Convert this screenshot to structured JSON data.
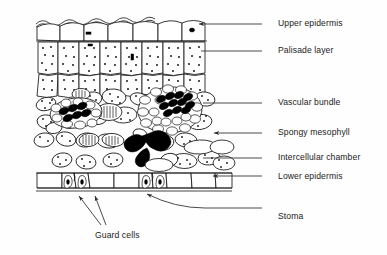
{
  "diagram": {
    "ink_color": "#141414",
    "background_color": "#fefefe",
    "xylem_fill": "#000000",
    "chamber_fill": "#000000"
  },
  "labels": [
    {
      "id": "upper-epidermis",
      "text": "Upper epidermis",
      "x": 278,
      "y": 19,
      "leader_y": 24,
      "leader_x1": 262,
      "leader_x2": 200,
      "arrow": true,
      "arrow_x": 199
    },
    {
      "id": "palisade-layer",
      "text": "Palisade layer",
      "x": 278,
      "y": 46,
      "leader_y": 51,
      "leader_x1": 262,
      "leader_x2": 201,
      "arrow": false,
      "arrow_x": 201
    },
    {
      "id": "vascular-bundle",
      "text": "Vascular bundle",
      "x": 278,
      "y": 98,
      "leader_y": 103,
      "leader_x1": 262,
      "leader_x2": 203,
      "arrow": false,
      "arrow_x": 203
    },
    {
      "id": "spongy-mesophyll",
      "text": "Spongy mesophyll",
      "x": 278,
      "y": 128,
      "leader_y": 133,
      "leader_x1": 262,
      "leader_x2": 215,
      "arrow": true,
      "arrow_x": 214
    },
    {
      "id": "intercellular-chamber",
      "text": "Intercellular chamber",
      "x": 278,
      "y": 153,
      "leader_y": 158,
      "leader_x1": 262,
      "leader_x2": 203,
      "arrow": false,
      "arrow_x": 203
    },
    {
      "id": "lower-epidermis",
      "text": "Lower epidermis",
      "x": 278,
      "y": 172,
      "leader_y": 176,
      "leader_x1": 262,
      "leader_x2": 214,
      "arrow": true,
      "arrow_x": 213
    },
    {
      "id": "stoma",
      "text": "Stoma",
      "x": 278,
      "y": 212,
      "leader_y": 208,
      "leader_x1": 262,
      "leader_x2": 200,
      "arrow": false,
      "arrow_x": 200
    },
    {
      "id": "guard-cells",
      "text": "Guard cells",
      "x": 95,
      "y": 231,
      "leader_y": 0,
      "leader_x1": 0,
      "leader_x2": 0,
      "arrow": false,
      "arrow_x": 0
    }
  ],
  "structures": {
    "upper_epidermis": {
      "name": "Upper epidermis",
      "cell_count": 7,
      "description": "single row of flattened rectangular cells along the top with a wavy cuticle line above"
    },
    "palisade_layer": {
      "name": "Palisade layer",
      "rows": 2,
      "description": "columnar cells packed with chloroplast dots"
    },
    "vascular_bundles": {
      "name": "Vascular bundle",
      "count": 2,
      "description": "oval bundles with dark filled xylem cells and surrounding sheath"
    },
    "spongy_mesophyll": {
      "name": "Spongy mesophyll",
      "description": "loosely packed rounded cells with air spaces"
    },
    "intercellular_chamber": {
      "name": "Intercellular chamber",
      "description": "solid black air space above the stoma"
    },
    "lower_epidermis": {
      "name": "Lower epidermis",
      "description": "single row of flattened cells along the bottom"
    },
    "stomata": {
      "name": "Stoma",
      "count": 3,
      "description": "pores between pairs of guard cells in the lower epidermis"
    },
    "guard_cells": {
      "name": "Guard cells",
      "description": "bean-shaped cells flanking each stomatal pore"
    }
  },
  "arrow_leaders": {
    "guard_cell_pointer_1": {
      "from_x": 101,
      "from_y": 225,
      "to_x": 79,
      "to_y": 194
    },
    "guard_cell_pointer_2": {
      "from_x": 106,
      "from_y": 225,
      "to_x": 95,
      "to_y": 194
    },
    "stoma_pointer": {
      "from_x": 200,
      "from_y": 208,
      "to_x": 146,
      "to_y": 192
    }
  }
}
